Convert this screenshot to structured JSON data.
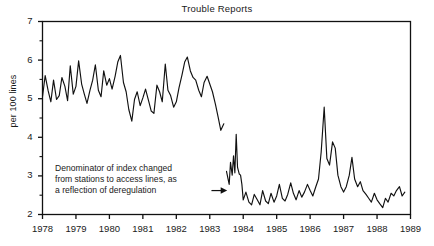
{
  "chart_data": {
    "type": "line",
    "title": "Trouble Reports",
    "xlabel": "",
    "ylabel": "per 100 lines",
    "xlim": [
      1978,
      1989
    ],
    "ylim": [
      2,
      7
    ],
    "grid": false,
    "legend": "none",
    "y_ticks": [
      2,
      3,
      4,
      5,
      6,
      7
    ],
    "y_tick_labels": [
      "2",
      "3",
      "4",
      "5",
      "6",
      "7"
    ],
    "y_minor_ticks": [
      2.5,
      3.5,
      4.5,
      5.5,
      6.5
    ],
    "x_ticks": [
      1978,
      1979,
      1980,
      1981,
      1982,
      1983,
      1984,
      1985,
      1986,
      1987,
      1988,
      1989
    ],
    "x_tick_labels": [
      "1978",
      "1979",
      "1980",
      "1981",
      "1982",
      "1983",
      "1984",
      "1985",
      "1986",
      "1987",
      "1988",
      "1989"
    ],
    "annotations": [
      {
        "name": "denominator-change-note",
        "lines": [
          "Denominator of index changed",
          "from stations to access lines, as",
          "a reflection of deregulation"
        ],
        "arrow_from_x": 1983.05,
        "arrow_from_y": 2.62,
        "arrow_to_x": 1983.52,
        "arrow_to_y": 2.62
      }
    ],
    "series": [
      {
        "name": "Trouble reports per 100 stations",
        "x": [
          1978.0,
          1978.08,
          1978.17,
          1978.25,
          1978.33,
          1978.42,
          1978.5,
          1978.58,
          1978.67,
          1978.75,
          1978.83,
          1978.92,
          1979.0,
          1979.08,
          1979.17,
          1979.25,
          1979.33,
          1979.42,
          1979.5,
          1979.58,
          1979.67,
          1979.75,
          1979.83,
          1979.92,
          1980.0,
          1980.08,
          1980.17,
          1980.25,
          1980.33,
          1980.42,
          1980.5,
          1980.58,
          1980.67,
          1980.75,
          1980.83,
          1980.92,
          1981.0,
          1981.08,
          1981.17,
          1981.25,
          1981.33,
          1981.42,
          1981.5,
          1981.58,
          1981.67,
          1981.75,
          1981.83,
          1981.92,
          1982.0,
          1982.08,
          1982.17,
          1982.25,
          1982.33,
          1982.42,
          1982.5,
          1982.58,
          1982.67,
          1982.75,
          1982.83,
          1982.92,
          1983.0,
          1983.08,
          1983.17,
          1983.25,
          1983.33,
          1983.42
        ],
        "values": [
          5.05,
          5.6,
          5.2,
          4.92,
          5.48,
          4.98,
          5.08,
          5.55,
          5.32,
          4.95,
          5.85,
          5.12,
          5.32,
          5.98,
          5.38,
          5.12,
          4.88,
          5.22,
          5.48,
          5.88,
          5.22,
          5.05,
          5.72,
          5.35,
          5.52,
          5.25,
          5.58,
          5.95,
          6.12,
          5.42,
          5.18,
          4.72,
          4.42,
          4.98,
          5.18,
          4.82,
          5.02,
          5.25,
          4.95,
          4.68,
          4.62,
          5.35,
          5.18,
          4.92,
          5.9,
          5.22,
          5.08,
          4.78,
          4.92,
          5.28,
          5.62,
          5.95,
          6.08,
          5.72,
          5.55,
          5.48,
          5.22,
          5.05,
          5.42,
          5.58,
          5.38,
          5.18,
          4.85,
          4.52,
          4.18,
          4.35
        ]
      },
      {
        "name": "Trouble reports per 100 access lines",
        "x": [
          1983.5,
          1983.58,
          1983.62,
          1983.67,
          1983.71,
          1983.75,
          1983.79,
          1983.83,
          1983.88,
          1983.92,
          1983.96,
          1984.0,
          1984.08,
          1984.17,
          1984.25,
          1984.33,
          1984.42,
          1984.5,
          1984.58,
          1984.67,
          1984.75,
          1984.83,
          1984.92,
          1985.0,
          1985.08,
          1985.17,
          1985.25,
          1985.33,
          1985.42,
          1985.5,
          1985.58,
          1985.67,
          1985.75,
          1985.83,
          1985.92,
          1986.0,
          1986.08,
          1986.17,
          1986.25,
          1986.33,
          1986.42,
          1986.5,
          1986.58,
          1986.67,
          1986.75,
          1986.83,
          1986.92,
          1987.0,
          1987.08,
          1987.17,
          1987.25,
          1987.33,
          1987.42,
          1987.5,
          1987.58,
          1987.67,
          1987.75,
          1987.83,
          1987.92,
          1988.0,
          1988.08,
          1988.17,
          1988.25,
          1988.33,
          1988.42,
          1988.5,
          1988.58,
          1988.67,
          1988.75,
          1988.83
        ],
        "values": [
          3.12,
          2.78,
          3.35,
          3.02,
          3.52,
          3.08,
          4.08,
          3.22,
          3.05,
          3.02,
          2.78,
          2.38,
          2.58,
          2.32,
          2.25,
          2.52,
          2.38,
          2.25,
          2.62,
          2.35,
          2.28,
          2.55,
          2.32,
          2.48,
          2.78,
          2.42,
          2.35,
          2.52,
          2.82,
          2.55,
          2.38,
          2.62,
          2.45,
          2.58,
          2.78,
          2.62,
          2.48,
          2.72,
          2.92,
          3.62,
          4.78,
          3.45,
          3.28,
          3.88,
          3.72,
          3.02,
          2.72,
          2.58,
          2.72,
          3.02,
          3.48,
          2.92,
          2.72,
          2.85,
          2.62,
          2.52,
          2.42,
          2.32,
          2.55,
          2.38,
          2.28,
          2.18,
          2.42,
          2.32,
          2.55,
          2.48,
          2.62,
          2.72,
          2.48,
          2.58
        ]
      }
    ]
  }
}
